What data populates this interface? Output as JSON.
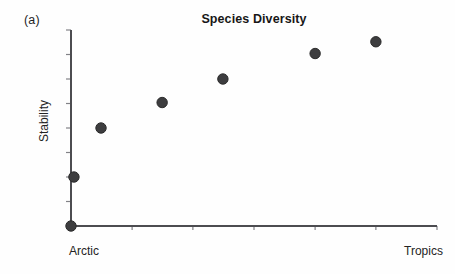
{
  "figure": {
    "panel_label": "(a)"
  },
  "colors": {
    "axis": "#4c4c50",
    "tick": "#828287",
    "dot_fill": "#3d3d3f",
    "dot_edge": "#2b2b2b",
    "title_text": "#171717",
    "label_text": "#242424"
  },
  "chart_data": {
    "type": "scatter",
    "title": "Species Diversity",
    "ylabel": "Stability",
    "xlabel": "",
    "x_end_labels": {
      "left": "Arctic",
      "right": "Tropics"
    },
    "x_axis": {
      "range": [
        0,
        1
      ],
      "numeric_labels_shown": false,
      "tick_fractions": [
        0.167,
        0.333,
        0.5,
        0.667,
        0.833,
        1.0
      ]
    },
    "y_axis": {
      "range": [
        0,
        1
      ],
      "numeric_labels_shown": false,
      "tick_fractions": [
        0.125,
        0.25,
        0.375,
        0.5,
        0.625,
        0.75,
        0.875,
        1.0
      ]
    },
    "grid": false,
    "legend": false,
    "points": [
      {
        "x": 0.0,
        "y": 0.0
      },
      {
        "x": 0.008,
        "y": 0.25
      },
      {
        "x": 0.082,
        "y": 0.5
      },
      {
        "x": 0.249,
        "y": 0.63
      },
      {
        "x": 0.415,
        "y": 0.75
      },
      {
        "x": 0.667,
        "y": 0.88
      },
      {
        "x": 0.833,
        "y": 0.94
      }
    ],
    "point_radius_px": 5.2
  }
}
